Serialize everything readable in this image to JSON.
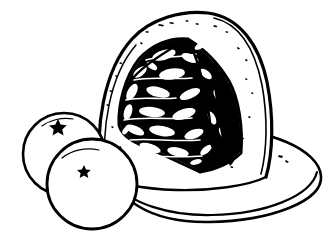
{
  "artwork": {
    "title": "Domed Cassata Pudding with Two Oranges on a Platter",
    "medium": "black ink line drawing",
    "style": "hand-drawn pen-and-ink sketch, pure black on white, no greyscale",
    "canvas": {
      "width": 333,
      "height": 236,
      "background_color": "#ffffff"
    },
    "palette": {
      "ink": "#000000",
      "paper": "#ffffff"
    },
    "subjects": [
      {
        "name": "domed-pudding",
        "label": "Domed pudding",
        "description": "Tall rounded dome-shaped moulded dessert with a wedge cut out of the front revealing a dense studded interior",
        "outline_color": "#000000",
        "body_color": "#ffffff",
        "approx_bounds": {
          "x": 95,
          "y": 12,
          "width": 175,
          "height": 170
        }
      },
      {
        "name": "cut-wedge-interior",
        "label": "Cut wedge interior",
        "description": "Triangular cut face packed with pale fruit and nut pieces suspended in a very dark matrix",
        "fill_color": "#000000",
        "inclusion_color": "#ffffff",
        "approx_bounds": {
          "x": 118,
          "y": 40,
          "width": 110,
          "height": 125
        }
      },
      {
        "name": "orange-back",
        "label": "Back orange",
        "description": "Round citrus fruit behind and to the left, with a small five-pointed star calyx near its top",
        "outline_color": "#000000",
        "body_color": "#ffffff",
        "approx_bounds": {
          "x": 20,
          "y": 113,
          "width": 88,
          "height": 82
        }
      },
      {
        "name": "orange-front",
        "label": "Front orange",
        "description": "Round citrus fruit in front, overlapping the back orange, with a small five-pointed star calyx",
        "outline_color": "#000000",
        "body_color": "#ffffff",
        "approx_bounds": {
          "x": 46,
          "y": 139,
          "width": 92,
          "height": 90
        }
      },
      {
        "name": "serving-platter",
        "label": "Serving platter",
        "description": "Wide shallow oval plate beneath the pudding, drawn with a doubled rim line",
        "outline_color": "#000000",
        "body_color": "#ffffff",
        "approx_bounds": {
          "x": 108,
          "y": 126,
          "width": 220,
          "height": 98
        }
      }
    ],
    "marks": [
      {
        "name": "star-calyx-back",
        "label": "Star calyx",
        "shape": "five-pointed-star",
        "cx": 58,
        "cy": 128,
        "r": 7
      },
      {
        "name": "star-calyx-front",
        "label": "Star calyx",
        "shape": "five-pointed-star",
        "cx": 84,
        "cy": 170,
        "r": 5.5
      },
      {
        "name": "stipple-speckles",
        "label": "Stipple speckles",
        "description": "Scattered tiny ink flecks across the pale dome surface",
        "count": 22
      }
    ]
  }
}
